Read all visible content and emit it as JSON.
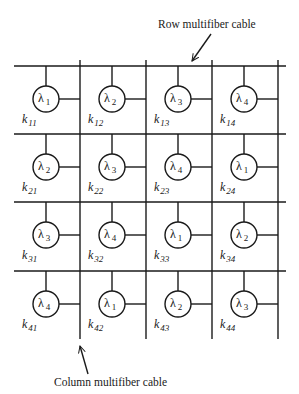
{
  "labels": {
    "row_cable": "Row multifiber cable",
    "column_cable": "Column multifiber cable"
  },
  "grid": {
    "rows": 4,
    "cols": 4,
    "row_line_y": [
      66,
      134,
      202,
      271
    ],
    "col_line_x": [
      80,
      146,
      212,
      278
    ],
    "line_x_start": 14,
    "line_x_end": 286,
    "col_y_start": 60,
    "col_y_end": 339
  },
  "nodes": [
    [
      {
        "wavelength": "λ",
        "index": "1",
        "k": "k",
        "k_index": "11"
      },
      {
        "wavelength": "λ",
        "index": "2",
        "k": "k",
        "k_index": "12"
      },
      {
        "wavelength": "λ",
        "index": "3",
        "k": "k",
        "k_index": "13"
      },
      {
        "wavelength": "λ",
        "index": "4",
        "k": "k",
        "k_index": "14"
      }
    ],
    [
      {
        "wavelength": "λ",
        "index": "2",
        "k": "k",
        "k_index": "21"
      },
      {
        "wavelength": "λ",
        "index": "3",
        "k": "k",
        "k_index": "22"
      },
      {
        "wavelength": "λ",
        "index": "4",
        "k": "k",
        "k_index": "23"
      },
      {
        "wavelength": "λ",
        "index": "1",
        "k": "k",
        "k_index": "24"
      }
    ],
    [
      {
        "wavelength": "λ",
        "index": "3",
        "k": "k",
        "k_index": "31"
      },
      {
        "wavelength": "λ",
        "index": "4",
        "k": "k",
        "k_index": "32"
      },
      {
        "wavelength": "λ",
        "index": "1",
        "k": "k",
        "k_index": "33"
      },
      {
        "wavelength": "λ",
        "index": "2",
        "k": "k",
        "k_index": "34"
      }
    ],
    [
      {
        "wavelength": "λ",
        "index": "4",
        "k": "k",
        "k_index": "41"
      },
      {
        "wavelength": "λ",
        "index": "1",
        "k": "k",
        "k_index": "42"
      },
      {
        "wavelength": "λ",
        "index": "2",
        "k": "k",
        "k_index": "43"
      },
      {
        "wavelength": "λ",
        "index": "3",
        "k": "k",
        "k_index": "44"
      }
    ]
  ]
}
